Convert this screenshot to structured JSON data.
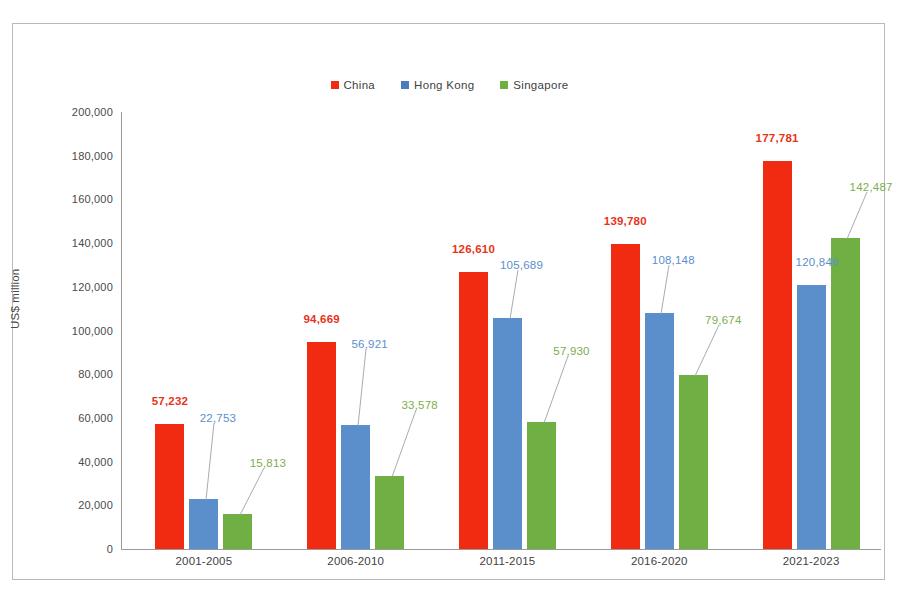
{
  "chart_data": {
    "type": "bar",
    "title": "",
    "xlabel": "",
    "ylabel": "US$ million",
    "ylim": [
      0,
      200000
    ],
    "ytick_step": 20000,
    "yticks": [
      "0",
      "20,000",
      "40,000",
      "60,000",
      "80,000",
      "100,000",
      "120,000",
      "140,000",
      "160,000",
      "180,000",
      "200,000"
    ],
    "grid": false,
    "legend_position": "top-center",
    "categories": [
      "2001-2005",
      "2006-2010",
      "2011-2015",
      "2016-2020",
      "2021-2023"
    ],
    "series": [
      {
        "name": "China",
        "color": "#F02B11",
        "label_color": "#E8331A",
        "bold_labels": true,
        "values": [
          57232,
          94669,
          126610,
          139780,
          177781
        ],
        "value_labels": [
          "57,232",
          "94,669",
          "126,610",
          "139,780",
          "177,781"
        ]
      },
      {
        "name": "Hong Kong",
        "color": "#5B8FCC",
        "label_color": "#5B8FCC",
        "bold_labels": false,
        "values": [
          22753,
          56921,
          105689,
          108148,
          120849
        ],
        "value_labels": [
          "22,753",
          "56,921",
          "105,689",
          "108,148",
          "120,849"
        ]
      },
      {
        "name": "Singapore",
        "color": "#6FAF43",
        "label_color": "#7DAE4E",
        "bold_labels": false,
        "values": [
          15813,
          33578,
          57930,
          79674,
          142487
        ],
        "value_labels": [
          "15,813",
          "33,578",
          "57,930",
          "79,674",
          "142,487"
        ]
      }
    ]
  },
  "legend": {
    "items": [
      {
        "label": "China",
        "color": "#F02B11"
      },
      {
        "label": "Hong Kong",
        "color": "#4A7EBB"
      },
      {
        "label": "Singapore",
        "color": "#6FAF43"
      }
    ]
  },
  "axis": {
    "y_title": "US$ million"
  },
  "caption": {
    "text": ""
  }
}
